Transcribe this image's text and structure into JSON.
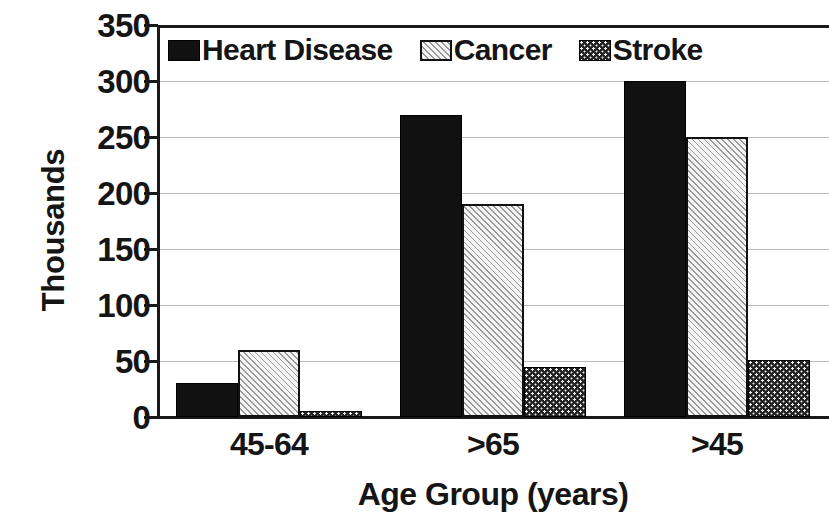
{
  "chart_data": {
    "type": "bar",
    "title": "",
    "subtitle": "",
    "xlabel": "Age Group (years)",
    "ylabel": "Thousands",
    "categories": [
      "45-64",
      ">65",
      ">45"
    ],
    "series": [
      {
        "name": "Heart Disease",
        "values": [
          30,
          270,
          300
        ],
        "pattern": "solid-black"
      },
      {
        "name": "Cancer",
        "values": [
          60,
          190,
          250
        ],
        "pattern": "diagonal-hatch"
      },
      {
        "name": "Stroke",
        "values": [
          5,
          45,
          51
        ],
        "pattern": "dotted-stipple"
      }
    ],
    "ylim": [
      0,
      350
    ],
    "yticks": [
      0,
      50,
      100,
      150,
      200,
      250,
      300,
      350
    ],
    "ytick_labels": [
      "0",
      "50",
      "100",
      "150",
      "200",
      "250",
      "300",
      "350"
    ],
    "grid": true,
    "grid_axis": "y",
    "legend_position": "top-left-inside",
    "bar_gap_within_group": 0,
    "colors": {
      "heart_disease": "#111111",
      "cancer": "#f2f2f2",
      "stroke": "#242424",
      "axis": "#1a1a1a",
      "gridline": "#b9b9b9",
      "text": "#151515",
      "background": "#ffffff"
    }
  },
  "legend": {
    "entries": [
      {
        "label": "Heart Disease"
      },
      {
        "label": "Cancer"
      },
      {
        "label": "Stroke"
      }
    ]
  }
}
